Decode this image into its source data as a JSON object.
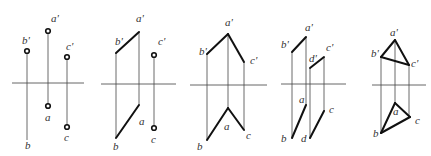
{
  "diagram": {
    "panels": [
      {
        "id": "panel-1",
        "axis": {
          "x1": 12,
          "x2": 84,
          "y": 83
        },
        "projectors": [
          {
            "x": 27,
            "y1": 51,
            "y2": 140
          },
          {
            "x": 48,
            "y1": 31,
            "y2": 106
          },
          {
            "x": 67,
            "y1": 57,
            "y2": 127
          }
        ],
        "segments": [],
        "points": [
          {
            "x": 27,
            "y": 51
          },
          {
            "x": 48,
            "y": 31
          },
          {
            "x": 67,
            "y": 57
          },
          {
            "x": 48,
            "y": 106
          },
          {
            "x": 67,
            "y": 127
          }
        ],
        "labels": [
          {
            "text": "b'",
            "x": 22,
            "y": 44
          },
          {
            "text": "a'",
            "x": 51,
            "y": 22
          },
          {
            "text": "c'",
            "x": 66,
            "y": 50
          },
          {
            "text": "a",
            "x": 45,
            "y": 121
          },
          {
            "text": "b",
            "x": 25,
            "y": 149
          },
          {
            "text": "c",
            "x": 64,
            "y": 141
          }
        ]
      },
      {
        "id": "panel-2",
        "axis": {
          "x1": 101,
          "x2": 176,
          "y": 84
        },
        "projectors": [
          {
            "x": 116,
            "y1": 53,
            "y2": 138
          },
          {
            "x": 139,
            "y1": 32,
            "y2": 105
          },
          {
            "x": 154,
            "y1": 55,
            "y2": 128
          }
        ],
        "segments": [
          {
            "x1": 116,
            "y1": 53,
            "x2": 139,
            "y2": 32
          },
          {
            "x1": 116,
            "y1": 138,
            "x2": 139,
            "y2": 105
          }
        ],
        "points": [
          {
            "x": 154,
            "y": 55
          },
          {
            "x": 154,
            "y": 128
          }
        ],
        "labels": [
          {
            "text": "b'",
            "x": 115,
            "y": 45
          },
          {
            "text": "a'",
            "x": 136,
            "y": 22
          },
          {
            "text": "c'",
            "x": 158,
            "y": 45
          },
          {
            "text": "a",
            "x": 139,
            "y": 125
          },
          {
            "text": "b",
            "x": 113,
            "y": 150
          },
          {
            "text": "c",
            "x": 151,
            "y": 143
          }
        ]
      },
      {
        "id": "panel-3",
        "axis": {
          "x1": 190,
          "x2": 267,
          "y": 85
        },
        "projectors": [
          {
            "x": 207,
            "y1": 54,
            "y2": 140
          },
          {
            "x": 228,
            "y1": 34,
            "y2": 108
          },
          {
            "x": 244,
            "y1": 62,
            "y2": 130
          }
        ],
        "segments": [
          {
            "x1": 207,
            "y1": 54,
            "x2": 228,
            "y2": 34
          },
          {
            "x1": 228,
            "y1": 34,
            "x2": 244,
            "y2": 62
          },
          {
            "x1": 207,
            "y1": 140,
            "x2": 228,
            "y2": 108
          },
          {
            "x1": 228,
            "y1": 108,
            "x2": 244,
            "y2": 130
          }
        ],
        "points": [],
        "labels": [
          {
            "text": "b'",
            "x": 199,
            "y": 55
          },
          {
            "text": "a'",
            "x": 225,
            "y": 26
          },
          {
            "text": "c'",
            "x": 250,
            "y": 64
          },
          {
            "text": "a",
            "x": 224,
            "y": 130
          },
          {
            "text": "b",
            "x": 197,
            "y": 150
          },
          {
            "text": "c",
            "x": 246,
            "y": 139
          }
        ]
      },
      {
        "id": "panel-4",
        "axis": {
          "x1": 281,
          "x2": 346,
          "y": 84
        },
        "projectors": [
          {
            "x": 292,
            "y1": 52,
            "y2": 138
          },
          {
            "x": 306,
            "y1": 37,
            "y2": 105
          },
          {
            "x": 310,
            "y1": 68,
            "y2": 138
          },
          {
            "x": 324,
            "y1": 57,
            "y2": 111
          }
        ],
        "segments": [
          {
            "x1": 292,
            "y1": 52,
            "x2": 306,
            "y2": 37
          },
          {
            "x1": 310,
            "y1": 68,
            "x2": 324,
            "y2": 57
          },
          {
            "x1": 292,
            "y1": 138,
            "x2": 306,
            "y2": 105
          },
          {
            "x1": 310,
            "y1": 138,
            "x2": 324,
            "y2": 111
          }
        ],
        "points": [],
        "labels": [
          {
            "text": "b'",
            "x": 281,
            "y": 48
          },
          {
            "text": "a'",
            "x": 305,
            "y": 31
          },
          {
            "text": "d'",
            "x": 309,
            "y": 62
          },
          {
            "text": "c'",
            "x": 326,
            "y": 51
          },
          {
            "text": "a",
            "x": 299,
            "y": 103
          },
          {
            "text": "b",
            "x": 281,
            "y": 142
          },
          {
            "text": "d",
            "x": 301,
            "y": 142
          },
          {
            "text": "c",
            "x": 329,
            "y": 113
          }
        ]
      },
      {
        "id": "panel-5",
        "axis": {
          "x1": 372,
          "x2": 426,
          "y": 85
        },
        "projectors": [
          {
            "x": 381,
            "y1": 57,
            "y2": 133
          },
          {
            "x": 395,
            "y1": 40,
            "y2": 103
          },
          {
            "x": 409,
            "y1": 65,
            "y2": 117
          }
        ],
        "segments": [
          {
            "x1": 395,
            "y1": 40,
            "x2": 381,
            "y2": 57
          },
          {
            "x1": 381,
            "y1": 57,
            "x2": 409,
            "y2": 65
          },
          {
            "x1": 409,
            "y1": 65,
            "x2": 395,
            "y2": 40
          },
          {
            "x1": 395,
            "y1": 103,
            "x2": 410,
            "y2": 117
          },
          {
            "x1": 410,
            "y1": 117,
            "x2": 381,
            "y2": 133
          },
          {
            "x1": 381,
            "y1": 133,
            "x2": 395,
            "y2": 103
          }
        ],
        "points": [],
        "labels": [
          {
            "text": "a'",
            "x": 390,
            "y": 36
          },
          {
            "text": "b'",
            "x": 371,
            "y": 57
          },
          {
            "text": "c'",
            "x": 411,
            "y": 67
          },
          {
            "text": "a",
            "x": 393,
            "y": 115
          },
          {
            "text": "c",
            "x": 415,
            "y": 124
          },
          {
            "text": "b",
            "x": 373,
            "y": 137
          }
        ]
      }
    ]
  }
}
